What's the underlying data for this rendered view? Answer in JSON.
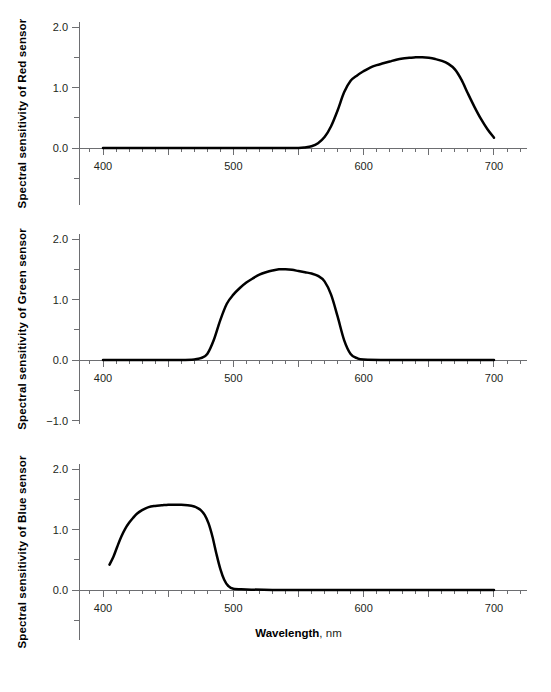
{
  "figure": {
    "background": "#ffffff",
    "curve_color": "#000000",
    "axis_color": "#6d6e71",
    "text_color": "#231f20",
    "xlabel_bold": "Wavelength",
    "xlabel_rest": ", nm"
  },
  "chart_data": [
    {
      "type": "line",
      "title": "",
      "panel": "red",
      "ylabel": "Spectral sensitivity of Red sensor",
      "xlabel": "Wavelength, nm",
      "xlim": [
        390,
        720
      ],
      "ylim": [
        -1.5,
        2.1
      ],
      "xticks": [
        400,
        500,
        600,
        700
      ],
      "xticklabels": [
        "400",
        "500",
        "600",
        "700"
      ],
      "minor_tick_step": 10,
      "yticks": [
        -1.0,
        -0.5,
        0.0,
        0.5,
        1.0,
        1.5,
        2.0
      ],
      "yticklabels": [
        "−1.0",
        "",
        "0.0",
        "",
        "1.0",
        "",
        "2.0"
      ],
      "grid": false,
      "legend": "none",
      "series": [
        {
          "name": "Red sensor",
          "x": [
            400,
            410,
            420,
            430,
            440,
            450,
            460,
            470,
            480,
            490,
            500,
            510,
            520,
            530,
            540,
            550,
            555,
            560,
            565,
            570,
            575,
            580,
            585,
            590,
            595,
            600,
            605,
            610,
            615,
            620,
            625,
            630,
            635,
            640,
            645,
            650,
            655,
            660,
            665,
            670,
            675,
            680,
            685,
            690,
            695,
            700
          ],
          "values": [
            0.0,
            0.0,
            0.0,
            0.0,
            0.0,
            0.0,
            0.0,
            0.0,
            0.0,
            0.0,
            0.0,
            0.0,
            0.0,
            0.0,
            0.0,
            0.0,
            0.01,
            0.03,
            0.08,
            0.18,
            0.36,
            0.62,
            0.92,
            1.11,
            1.2,
            1.27,
            1.33,
            1.37,
            1.4,
            1.43,
            1.46,
            1.48,
            1.49,
            1.5,
            1.5,
            1.49,
            1.47,
            1.44,
            1.39,
            1.3,
            1.13,
            0.9,
            0.68,
            0.48,
            0.31,
            0.17
          ]
        }
      ]
    },
    {
      "type": "line",
      "title": "",
      "panel": "green",
      "ylabel": "Spectral sensitivity of Green sensor",
      "xlabel": "Wavelength, nm",
      "xlim": [
        390,
        720
      ],
      "ylim": [
        -1.5,
        2.1
      ],
      "xticks": [
        400,
        500,
        600,
        700
      ],
      "xticklabels": [
        "400",
        "500",
        "600",
        "700"
      ],
      "minor_tick_step": 10,
      "yticks": [
        -1.0,
        -0.5,
        0.0,
        0.5,
        1.0,
        1.5,
        2.0
      ],
      "yticklabels": [
        "−1.0",
        "",
        "0.0",
        "",
        "1.0",
        "",
        "2.0"
      ],
      "grid": false,
      "legend": "none",
      "series": [
        {
          "name": "Green sensor",
          "x": [
            400,
            410,
            420,
            430,
            440,
            450,
            460,
            470,
            475,
            480,
            485,
            490,
            495,
            500,
            505,
            510,
            515,
            520,
            525,
            530,
            535,
            540,
            545,
            550,
            555,
            560,
            565,
            570,
            575,
            580,
            585,
            590,
            595,
            600,
            620,
            640,
            660,
            680,
            700
          ],
          "values": [
            0.0,
            0.0,
            0.0,
            0.0,
            0.0,
            0.0,
            0.0,
            0.01,
            0.03,
            0.1,
            0.33,
            0.66,
            0.93,
            1.08,
            1.19,
            1.28,
            1.35,
            1.41,
            1.45,
            1.48,
            1.5,
            1.5,
            1.49,
            1.47,
            1.45,
            1.43,
            1.39,
            1.3,
            1.08,
            0.72,
            0.33,
            0.1,
            0.03,
            0.01,
            0.0,
            0.0,
            0.0,
            0.0,
            0.0
          ]
        }
      ]
    },
    {
      "type": "line",
      "title": "",
      "panel": "blue",
      "ylabel": "Spectral sensitivity of Blue sensor",
      "xlabel": "Wavelength, nm",
      "xlim": [
        390,
        720
      ],
      "ylim": [
        -1.5,
        2.1
      ],
      "xticks": [
        400,
        500,
        600,
        700
      ],
      "xticklabels": [
        "400",
        "500",
        "600",
        "700"
      ],
      "minor_tick_step": 10,
      "yticks": [
        -1.0,
        -0.5,
        0.0,
        0.5,
        1.0,
        1.5,
        2.0
      ],
      "yticklabels": [
        "",
        "",
        "0.0",
        "",
        "1.0",
        "",
        "2.0"
      ],
      "grid": false,
      "legend": "none",
      "series": [
        {
          "name": "Blue sensor",
          "x": [
            405,
            408,
            411,
            414,
            417,
            420,
            423,
            426,
            430,
            435,
            440,
            445,
            450,
            455,
            460,
            465,
            470,
            472,
            475,
            478,
            481,
            484,
            487,
            490,
            493,
            496,
            500,
            510,
            530,
            550,
            570,
            590,
            610,
            630,
            650,
            670,
            690,
            700
          ],
          "values": [
            0.42,
            0.55,
            0.72,
            0.88,
            1.01,
            1.11,
            1.19,
            1.26,
            1.32,
            1.37,
            1.39,
            1.4,
            1.41,
            1.41,
            1.41,
            1.4,
            1.38,
            1.36,
            1.32,
            1.24,
            1.1,
            0.88,
            0.6,
            0.35,
            0.17,
            0.07,
            0.02,
            0.01,
            0.0,
            0.0,
            0.0,
            0.0,
            0.0,
            0.0,
            0.0,
            0.0,
            0.0,
            0.0
          ]
        }
      ]
    }
  ]
}
